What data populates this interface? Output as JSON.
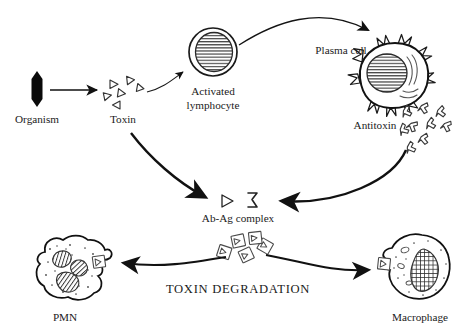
{
  "diagram": {
    "background_color": "#ffffff",
    "ink_color": "#1a1a1a",
    "labels": {
      "organism": "Organism",
      "toxin": "Toxin",
      "activated_lymphocyte_line1": "Activated",
      "activated_lymphocyte_line2": "lymphocyte",
      "plasma_cell": "Plasma cell",
      "antitoxin": "Antitoxin",
      "ab_ag_complex": "Ab-Ag complex",
      "toxin_degradation": "TOXIN DEGRADATION",
      "pmn": "PMN",
      "macrophage": "Macrophage"
    },
    "symbols": {
      "antigen_glyph": "triangle-outline",
      "antibody_glyph": "antibody-bracket",
      "plus_sign": "+"
    },
    "nodes": [
      {
        "id": "organism",
        "name": "Organism",
        "shape": "solid-hexagon-rod",
        "x": 37,
        "y": 89
      },
      {
        "id": "toxin",
        "name": "Toxin",
        "shape": "triangle-cluster",
        "count": 6,
        "x": 123,
        "y": 90
      },
      {
        "id": "activated-lymphocyte",
        "name": "Activated lymphocyte",
        "shape": "round-cell-striped-nucleus",
        "x": 213,
        "y": 52
      },
      {
        "id": "plasma-cell",
        "name": "Plasma cell",
        "shape": "spiky-cell-striped-nucleus",
        "x": 390,
        "y": 78
      },
      {
        "id": "antitoxin",
        "name": "Antitoxin",
        "shape": "antibody-cluster",
        "count": 9,
        "x": 420,
        "y": 108
      },
      {
        "id": "ab-ag-complex",
        "name": "Ab-Ag complex",
        "shape": "antigen-plus-antibody",
        "x": 234,
        "y": 201
      },
      {
        "id": "degradation-complexes",
        "name": "Ab-Ag complexes",
        "shape": "boxed-complex-cluster",
        "count": 5,
        "x": 243,
        "y": 250
      },
      {
        "id": "pmn",
        "name": "PMN",
        "shape": "amoeboid-cell-lobed-nucleus",
        "x": 65,
        "y": 275
      },
      {
        "id": "macrophage",
        "name": "Macrophage",
        "shape": "amoeboid-cell-kidney-nucleus",
        "x": 415,
        "y": 275
      }
    ],
    "arrows": [
      {
        "id": "organism-to-toxin",
        "from": "organism",
        "to": "toxin",
        "style": "straight-thin"
      },
      {
        "id": "toxin-to-lymphocyte",
        "from": "toxin",
        "to": "activated-lymphocyte",
        "style": "curved-thin"
      },
      {
        "id": "lymphocyte-to-plasma-cell",
        "from": "activated-lymphocyte",
        "to": "plasma-cell",
        "style": "curved-arc"
      },
      {
        "id": "toxin-to-complex",
        "from": "toxin",
        "to": "ab-ag-complex",
        "style": "curved-thick"
      },
      {
        "id": "antitoxin-to-complex",
        "from": "antitoxin",
        "to": "ab-ag-complex",
        "style": "curved-thick"
      },
      {
        "id": "complex-to-pmn",
        "from": "degradation-complexes",
        "to": "pmn",
        "style": "curved-thick"
      },
      {
        "id": "complex-to-macrophage",
        "from": "degradation-complexes",
        "to": "macrophage",
        "style": "curved-thick"
      }
    ]
  }
}
